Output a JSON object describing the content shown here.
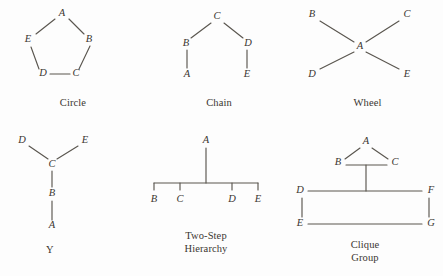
{
  "figure": {
    "background_color": "#fdfdfd",
    "line_color": "#5a564f",
    "text_color": "#3b3631",
    "width": 443,
    "height": 276,
    "kind": "communication-network-structures"
  },
  "diagrams": [
    {
      "id": "circle",
      "caption": "Circle",
      "node_count": 5,
      "nodes": [
        {
          "label": "A",
          "x": 62,
          "y": 14
        },
        {
          "label": "B",
          "x": 88,
          "y": 40
        },
        {
          "label": "C",
          "x": 76,
          "y": 74
        },
        {
          "label": "D",
          "x": 43,
          "y": 74
        },
        {
          "label": "E",
          "x": 32,
          "y": 40
        }
      ],
      "edges": [
        {
          "from": "A",
          "to": "B"
        },
        {
          "from": "B",
          "to": "C"
        },
        {
          "from": "C",
          "to": "D"
        },
        {
          "from": "D",
          "to": "E"
        },
        {
          "from": "E",
          "to": "A"
        }
      ]
    },
    {
      "id": "chain",
      "caption": "Chain",
      "node_count": 5,
      "nodes": [
        {
          "label": "A",
          "x": 41,
          "y": 75
        },
        {
          "label": "B",
          "x": 41,
          "y": 44
        },
        {
          "label": "C",
          "x": 71,
          "y": 18
        },
        {
          "label": "D",
          "x": 101,
          "y": 44
        },
        {
          "label": "E",
          "x": 101,
          "y": 75
        }
      ],
      "edges": [
        {
          "from": "A",
          "to": "B"
        },
        {
          "from": "B",
          "to": "C"
        },
        {
          "from": "C",
          "to": "D"
        },
        {
          "from": "D",
          "to": "E"
        }
      ]
    },
    {
      "id": "wheel",
      "caption": "Wheel",
      "node_count": 5,
      "nodes": [
        {
          "label": "A",
          "x": 68,
          "y": 47
        },
        {
          "label": "B",
          "x": 22,
          "y": 16
        },
        {
          "label": "C",
          "x": 113,
          "y": 16
        },
        {
          "label": "D",
          "x": 22,
          "y": 74
        },
        {
          "label": "E",
          "x": 113,
          "y": 74
        }
      ],
      "edges": [
        {
          "from": "A",
          "to": "B"
        },
        {
          "from": "A",
          "to": "C"
        },
        {
          "from": "A",
          "to": "D"
        },
        {
          "from": "A",
          "to": "E"
        }
      ]
    },
    {
      "id": "y",
      "caption": "Y",
      "node_count": 5,
      "nodes": [
        {
          "label": "A",
          "x": 52,
          "y": 94
        },
        {
          "label": "B",
          "x": 52,
          "y": 62
        },
        {
          "label": "C",
          "x": 52,
          "y": 32
        },
        {
          "label": "D",
          "x": 22,
          "y": 9
        },
        {
          "label": "E",
          "x": 84,
          "y": 9
        }
      ],
      "edges": [
        {
          "from": "A",
          "to": "B"
        },
        {
          "from": "B",
          "to": "C"
        },
        {
          "from": "C",
          "to": "D"
        },
        {
          "from": "C",
          "to": "E"
        }
      ]
    },
    {
      "id": "two-step-hierarchy",
      "caption": "Two-Step\nHierarchy",
      "node_count": 5,
      "nodes": [
        {
          "label": "A",
          "x": 66,
          "y": 9
        },
        {
          "label": "B",
          "x": 14,
          "y": 65
        },
        {
          "label": "C",
          "x": 40,
          "y": 65
        },
        {
          "label": "D",
          "x": 92,
          "y": 65
        },
        {
          "label": "E",
          "x": 118,
          "y": 65
        }
      ],
      "edges": [
        {
          "from": "A",
          "to": "bar"
        },
        {
          "from": "bar",
          "to": "B"
        },
        {
          "from": "bar",
          "to": "C"
        },
        {
          "from": "bar",
          "to": "D"
        },
        {
          "from": "bar",
          "to": "E"
        }
      ]
    },
    {
      "id": "clique-group",
      "caption": "Clique\nGroup",
      "node_count": 7,
      "nodes": [
        {
          "label": "A",
          "x": 74,
          "y": 10
        },
        {
          "label": "B",
          "x": 48,
          "y": 31
        },
        {
          "label": "C",
          "x": 101,
          "y": 31
        },
        {
          "label": "D",
          "x": 9,
          "y": 59
        },
        {
          "label": "F",
          "x": 137,
          "y": 59
        },
        {
          "label": "E",
          "x": 9,
          "y": 92
        },
        {
          "label": "G",
          "x": 137,
          "y": 92
        }
      ],
      "edges": [
        {
          "from": "A",
          "to": "B"
        },
        {
          "from": "A",
          "to": "C"
        },
        {
          "from": "B",
          "to": "C"
        },
        {
          "from": "BC-midpoint",
          "to": "DF-line"
        },
        {
          "from": "D",
          "to": "F"
        },
        {
          "from": "D",
          "to": "E"
        },
        {
          "from": "E",
          "to": "G"
        },
        {
          "from": "F",
          "to": "G"
        }
      ]
    }
  ]
}
